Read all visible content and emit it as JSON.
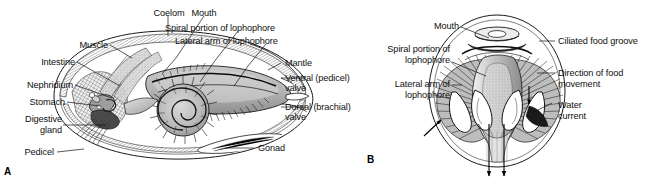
{
  "figure": {
    "background_color": "#ffffff",
    "line_color": "#111111",
    "text_color": "#101010"
  },
  "panels": [
    {
      "letter": "A",
      "name": "lateral-cutaway-view",
      "description": "Lateral cutaway of a brachiopod showing internal organs, spiral lophophore and shell valves",
      "labels": [
        {
          "id": "coelom",
          "text": "Coelom",
          "align": "center"
        },
        {
          "id": "mouth",
          "text": "Mouth",
          "align": "center"
        },
        {
          "id": "spiral_portion",
          "text": "Spiral portion of lophophore",
          "align": "left"
        },
        {
          "id": "lateral_arm",
          "text": "Lateral arm of lophophore",
          "align": "left"
        },
        {
          "id": "mantle",
          "text": "Mantle",
          "align": "left"
        },
        {
          "id": "ventral_valve_l1",
          "text": "Ventral (pedicel)",
          "align": "left"
        },
        {
          "id": "ventral_valve_l2",
          "text": "valve",
          "align": "left"
        },
        {
          "id": "dorsal_valve_l1",
          "text": "Dorsal (brachial)",
          "align": "left"
        },
        {
          "id": "dorsal_valve_l2",
          "text": "valve",
          "align": "left"
        },
        {
          "id": "gonad",
          "text": "Gonad",
          "align": "left"
        },
        {
          "id": "muscle",
          "text": "Muscle",
          "align": "right"
        },
        {
          "id": "intestine",
          "text": "Intestine",
          "align": "right"
        },
        {
          "id": "nephridium",
          "text": "Nephridium",
          "align": "right"
        },
        {
          "id": "stomach",
          "text": "Stomach",
          "align": "right"
        },
        {
          "id": "digestive_gland_l1",
          "text": "Digestive",
          "align": "right"
        },
        {
          "id": "digestive_gland_l2",
          "text": "gland",
          "align": "right"
        },
        {
          "id": "pedicel",
          "text": "Pedicel",
          "align": "right"
        }
      ]
    },
    {
      "letter": "B",
      "name": "anterior-lophophore-view",
      "description": "Anterior view into the opened shell showing the lophophore, ciliated food groove and water currents",
      "labels": [
        {
          "id": "mouth_b",
          "text": "Mouth",
          "align": "right"
        },
        {
          "id": "spiral_portion_b1",
          "text": "Spiral portion of",
          "align": "right"
        },
        {
          "id": "spiral_portion_b2",
          "text": "lophophore",
          "align": "right"
        },
        {
          "id": "lateral_arm_b1",
          "text": "Lateral arm of",
          "align": "right"
        },
        {
          "id": "lateral_arm_b2",
          "text": "lophophore",
          "align": "right"
        },
        {
          "id": "ciliated_groove",
          "text": "Ciliated food groove",
          "align": "left"
        },
        {
          "id": "food_direction_1",
          "text": "Direction of food",
          "align": "left"
        },
        {
          "id": "food_direction_2",
          "text": "movement",
          "align": "left"
        },
        {
          "id": "water_current_1",
          "text": "Water",
          "align": "left"
        },
        {
          "id": "water_current_2",
          "text": "current",
          "align": "left"
        }
      ]
    }
  ]
}
